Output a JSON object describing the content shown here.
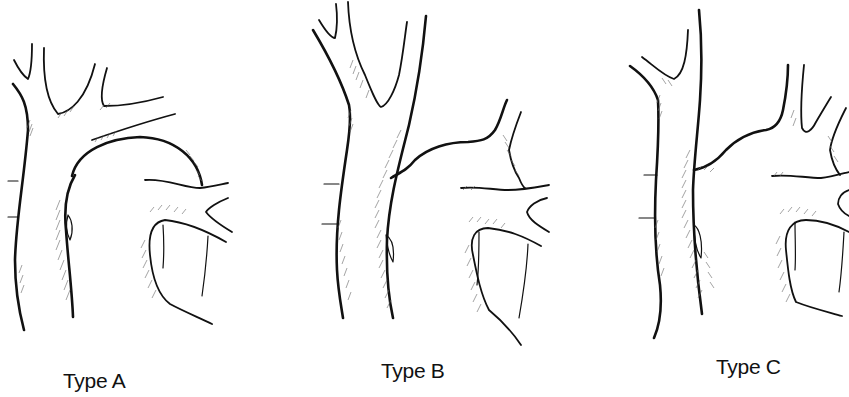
{
  "figure": {
    "panels": [
      {
        "id": "A",
        "label": "Type A"
      },
      {
        "id": "B",
        "label": "Type B"
      },
      {
        "id": "C",
        "label": "Type C"
      }
    ],
    "style": {
      "background": "#ffffff",
      "line_color": "#111111",
      "hatch_color": "#666666"
    }
  }
}
